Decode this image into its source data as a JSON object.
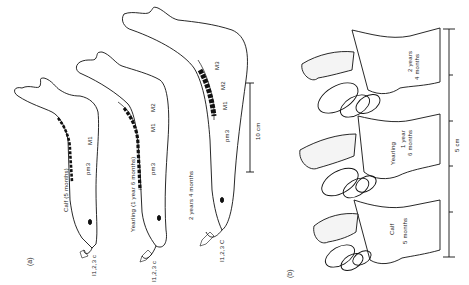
{
  "figure": {
    "panel_a": {
      "label": "(a)",
      "specimens": [
        {
          "age_label": "Calf (5 months)",
          "tooth_labels": [
            "M1",
            "pm3"
          ],
          "incisor_label": "I1,2,3 c"
        },
        {
          "age_label": "Yearling (1 year 6 months)",
          "tooth_labels": [
            "M2",
            "M1",
            "pm3"
          ],
          "incisor_label": "I1,2,3 c"
        },
        {
          "age_label": "2 years 4 months",
          "tooth_labels": [
            "M3",
            "M2",
            "M1",
            "pm3"
          ],
          "incisor_label": "I1,2,3 C"
        }
      ],
      "scale_bar": {
        "label": "10 cm"
      }
    },
    "panel_b": {
      "label": "(b)",
      "specimens": [
        {
          "age_label_line1": "2 years",
          "age_label_line2": "4 months"
        },
        {
          "age_label_line1": "Yearling",
          "age_label_line2": "1 year",
          "age_label_line3": "6 months"
        },
        {
          "age_label_line1": "Calf",
          "age_label_line2": "5 months"
        }
      ],
      "scale_bar": {
        "label": "5 cm",
        "ticks": 6
      }
    }
  }
}
